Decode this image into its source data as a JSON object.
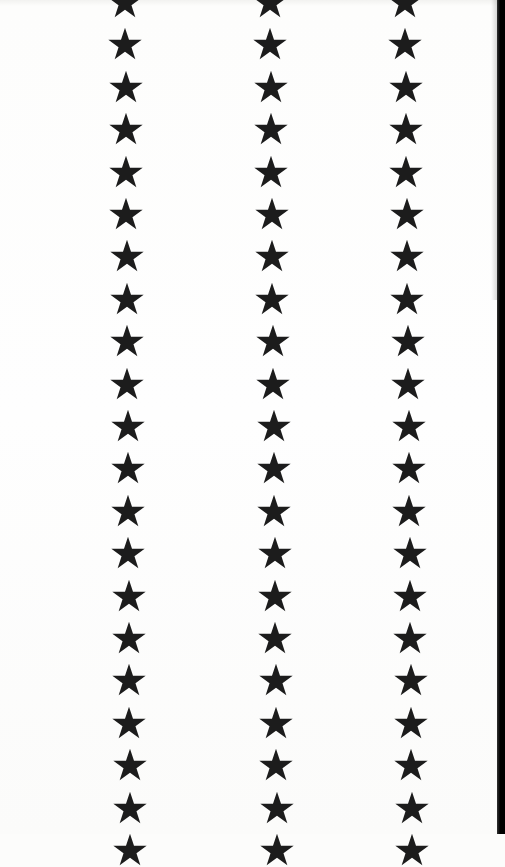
{
  "scene": {
    "description": "Photograph of white paper printed with three vertical columns of black five-pointed stars",
    "background_color": "#fdfdfc",
    "star_color": "#1c1c1c",
    "edge_color": "#000000"
  },
  "columns": [
    {
      "center_x": 125,
      "drift": 5
    },
    {
      "center_x": 270,
      "drift": 7
    },
    {
      "center_x": 405,
      "drift": 7
    }
  ],
  "star_pitch": 42.4,
  "first_star_y": -4,
  "star_count_per_column": 21,
  "star_size": 34
}
